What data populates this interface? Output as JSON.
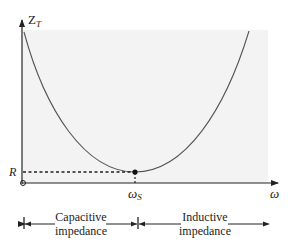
{
  "diagram": {
    "type": "impedance-vs-frequency",
    "y_axis": {
      "label": "Z",
      "label_subscript": "T"
    },
    "x_axis": {
      "label": "ω"
    },
    "markers": {
      "r_label": "R",
      "resonance_label": "ω",
      "resonance_subscript": "S"
    },
    "regions": [
      {
        "line1": "Capacitive",
        "line2": "impedance"
      },
      {
        "line1": "Inductive",
        "line2": "impedance"
      }
    ],
    "colors": {
      "plot_background": "#f3f3f3",
      "curve": "#555555",
      "axis": "#222222",
      "text": "#222222"
    }
  }
}
